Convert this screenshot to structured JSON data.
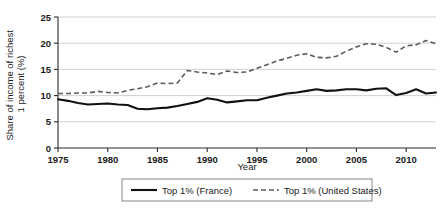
{
  "chart_data": {
    "type": "line",
    "title": "",
    "xlabel": "Year",
    "ylabel": "Share of income of richest 1 percent (%)",
    "xlim": [
      1975,
      2013
    ],
    "ylim": [
      0,
      25
    ],
    "grid": "horizontal",
    "legend_position": "bottom-outside",
    "xticks": [
      "1975",
      "1980",
      "1985",
      "1990",
      "1995",
      "2000",
      "2005",
      "2010"
    ],
    "yticks": [
      "0",
      "5",
      "10",
      "15",
      "20",
      "25"
    ],
    "x": [
      1975,
      1976,
      1977,
      1978,
      1979,
      1980,
      1981,
      1982,
      1983,
      1984,
      1985,
      1986,
      1987,
      1988,
      1989,
      1990,
      1991,
      1992,
      1993,
      1994,
      1995,
      1996,
      1997,
      1998,
      1999,
      2000,
      2001,
      2002,
      2003,
      2004,
      2005,
      2006,
      2007,
      2008,
      2009,
      2010,
      2011,
      2012,
      2013
    ],
    "series": [
      {
        "name": "Top 1% (France)",
        "style": "solid",
        "color": "#111111",
        "values": [
          9.3,
          9.0,
          8.6,
          8.3,
          8.4,
          8.5,
          8.3,
          8.2,
          7.5,
          7.4,
          7.6,
          7.7,
          8.0,
          8.4,
          8.8,
          9.5,
          9.2,
          8.7,
          8.9,
          9.1,
          9.1,
          9.6,
          10.0,
          10.4,
          10.6,
          10.9,
          11.2,
          10.9,
          11.0,
          11.2,
          11.2,
          11.0,
          11.3,
          11.4,
          10.1,
          10.5,
          11.2,
          10.4,
          10.6
        ]
      },
      {
        "name": "Top 1% (United States)",
        "style": "dashed",
        "color": "#5a5a5a",
        "values": [
          10.4,
          10.4,
          10.5,
          10.5,
          10.8,
          10.6,
          10.5,
          11.0,
          11.3,
          11.7,
          12.4,
          12.3,
          12.4,
          14.8,
          14.5,
          14.3,
          14.0,
          14.7,
          14.4,
          14.5,
          15.2,
          15.9,
          16.6,
          17.1,
          17.7,
          18.0,
          17.3,
          17.2,
          17.5,
          18.5,
          19.3,
          19.9,
          19.8,
          19.2,
          18.3,
          19.5,
          19.7,
          20.5,
          19.9
        ]
      }
    ]
  },
  "legend": {
    "items": [
      {
        "label": "Top 1% (France)"
      },
      {
        "label": "Top 1% (United States)"
      }
    ]
  }
}
